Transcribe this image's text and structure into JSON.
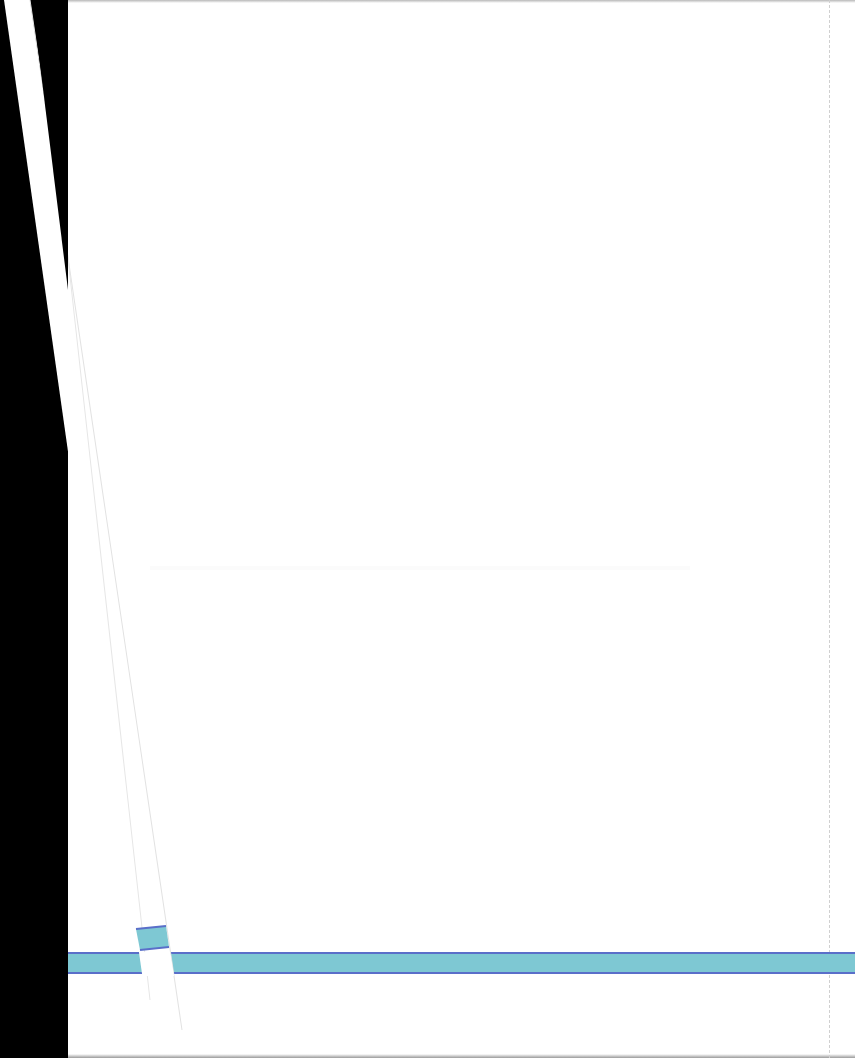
{
  "scene": {
    "description": "Scanned blank page with a diagonal paper strip and a teal horizontal band",
    "text_content": []
  },
  "colors": {
    "background": "#000000",
    "page": "#ffffff",
    "band_fill": "#7ec8d3",
    "band_border": "#5a6fc9",
    "dashed_line": "#d0d0d0"
  }
}
